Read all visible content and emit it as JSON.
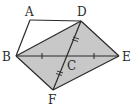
{
  "diagram": {
    "type": "geometry",
    "colors": {
      "stroke": "#2a2a2a",
      "fill": "#c8c8c8",
      "background": "#ffffff"
    },
    "points": {
      "A": {
        "label": "A",
        "x": 30,
        "y": 20
      },
      "B": {
        "label": "B",
        "x": 16,
        "y": 56
      },
      "C": {
        "label": "C",
        "x": 69,
        "y": 56
      },
      "D": {
        "label": "D",
        "x": 81,
        "y": 21
      },
      "E": {
        "label": "E",
        "x": 119,
        "y": 56
      },
      "F": {
        "label": "F",
        "x": 53,
        "y": 90
      }
    },
    "shaded_quadrilateral": [
      "B",
      "D",
      "E",
      "F"
    ],
    "segments": [
      [
        "A",
        "D"
      ],
      [
        "A",
        "B"
      ],
      [
        "B",
        "D"
      ],
      [
        "D",
        "E"
      ],
      [
        "E",
        "F"
      ],
      [
        "F",
        "B"
      ],
      [
        "B",
        "E"
      ],
      [
        "D",
        "F"
      ]
    ],
    "tick_marks": {
      "single": [
        "BC",
        "CE"
      ],
      "double": [
        "DC",
        "CF"
      ]
    }
  }
}
